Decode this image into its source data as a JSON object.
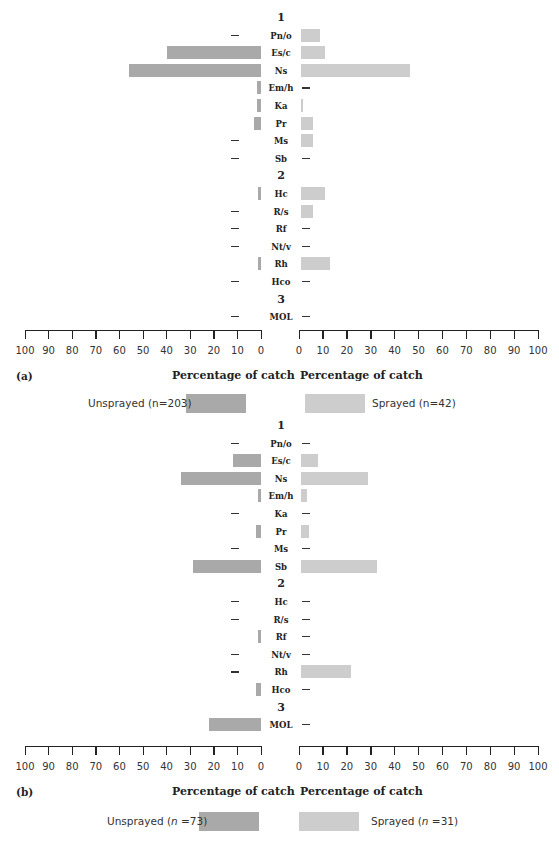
{
  "chart_data": [
    {
      "type": "bar",
      "orientation": "horizontal-butterfly",
      "panel_label": "(a)",
      "groups": [
        "1",
        "2",
        "3"
      ],
      "categories": [
        "Pn/o",
        "Es/c",
        "Ns",
        "Em/h",
        "Ka",
        "Pr",
        "Ms",
        "Sb",
        "Hc",
        "R/s",
        "Rf",
        "Nt/v",
        "Rh",
        "Hco",
        "MOL"
      ],
      "category_groups": [
        "1",
        "1",
        "1",
        "1",
        "1",
        "1",
        "1",
        "1",
        "2",
        "2",
        "2",
        "2",
        "2",
        "2",
        "3"
      ],
      "series": [
        {
          "name": "Unsprayed (n=203)",
          "side": "left",
          "color": "#a9a9a9",
          "values": [
            0,
            40,
            56,
            1.5,
            1.5,
            3,
            0,
            0,
            1,
            0,
            0,
            0,
            1,
            0,
            0
          ]
        },
        {
          "name": "Sprayed (n=42)",
          "side": "right",
          "color": "#cdcdcd",
          "values": [
            8,
            10,
            46,
            0,
            0.5,
            5,
            5,
            0,
            10,
            5,
            0,
            0,
            12,
            0,
            0
          ]
        }
      ],
      "xlabel_left": "Percentage of catch",
      "xlabel_right": "Percentage of catch",
      "xlim": [
        0,
        100
      ],
      "ticks": [
        0,
        10,
        20,
        30,
        40,
        50,
        60,
        70,
        80,
        90,
        100
      ],
      "grid": false,
      "legend_position": "bottom"
    },
    {
      "type": "bar",
      "orientation": "horizontal-butterfly",
      "panel_label": "(b)",
      "groups": [
        "1",
        "2",
        "3"
      ],
      "categories": [
        "Pn/o",
        "Es/c",
        "Ns",
        "Em/h",
        "Ka",
        "Pr",
        "Ms",
        "Sb",
        "Hc",
        "R/s",
        "Rf",
        "Nt/v",
        "Rh",
        "Hco",
        "MOL"
      ],
      "category_groups": [
        "1",
        "1",
        "1",
        "1",
        "1",
        "1",
        "1",
        "1",
        "2",
        "2",
        "2",
        "2",
        "2",
        "2",
        "3"
      ],
      "series": [
        {
          "name": "Unsprayed (n =73)",
          "side": "left",
          "color": "#a9a9a9",
          "values": [
            0,
            12,
            34,
            1,
            0,
            2,
            0,
            29,
            0,
            0,
            1,
            0,
            0,
            2,
            22
          ]
        },
        {
          "name": "Sprayed (n =31)",
          "side": "right",
          "color": "#cdcdcd",
          "values": [
            0,
            7,
            28,
            2.5,
            0,
            3.5,
            0,
            32,
            0,
            0,
            0,
            0,
            21,
            0,
            0
          ]
        }
      ],
      "xlabel_left": "Percentage of catch",
      "xlabel_right": "Percentage of catch",
      "xlim": [
        0,
        100
      ],
      "ticks": [
        0,
        10,
        20,
        30,
        40,
        50,
        60,
        70,
        80,
        90,
        100
      ],
      "grid": false,
      "legend_position": "bottom"
    }
  ],
  "panels": [
    {
      "label": "(a)",
      "xlabel_left": "Percentage of catch",
      "xlabel_right": "Percentage of catch",
      "legend_unsprayed": "Unsprayed (n=203)",
      "legend_sprayed": "Sprayed (n=42)"
    },
    {
      "label": "(b)",
      "xlabel_left": "Percentage of catch",
      "xlabel_right": "Percentage of catch",
      "legend_unsprayed_pre": "Unsprayed (",
      "legend_unsprayed_n": "n",
      "legend_unsprayed_post": " =73)",
      "legend_sprayed_pre": "Sprayed (",
      "legend_sprayed_n": "n",
      "legend_sprayed_post": " =31)"
    }
  ],
  "colors": {
    "unsprayed": "#a9a9a9",
    "sprayed": "#cdcdcd",
    "axis": "#222222"
  }
}
